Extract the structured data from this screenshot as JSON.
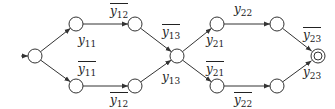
{
  "diagram": {
    "type": "finite-automaton",
    "nodes": [
      {
        "id": "s0",
        "x": 35,
        "y": 56,
        "kind": "initial"
      },
      {
        "id": "s1",
        "x": 76,
        "y": 24
      },
      {
        "id": "s2",
        "x": 76,
        "y": 86
      },
      {
        "id": "s3",
        "x": 135,
        "y": 24
      },
      {
        "id": "s4",
        "x": 135,
        "y": 86
      },
      {
        "id": "s5",
        "x": 177,
        "y": 56
      },
      {
        "id": "s6",
        "x": 217,
        "y": 24
      },
      {
        "id": "s7",
        "x": 217,
        "y": 86
      },
      {
        "id": "s8",
        "x": 277,
        "y": 24
      },
      {
        "id": "s9",
        "x": 277,
        "y": 86
      },
      {
        "id": "s10",
        "x": 318,
        "y": 56,
        "kind": "accepting"
      }
    ],
    "edges": [
      {
        "from": "s0",
        "to": "s1",
        "label": "y11"
      },
      {
        "from": "s0",
        "to": "s2",
        "label": "not y11"
      },
      {
        "from": "s1",
        "to": "s3",
        "label": "not y12"
      },
      {
        "from": "s2",
        "to": "s4",
        "label": "not y12"
      },
      {
        "from": "s3",
        "to": "s5",
        "label": "not y13"
      },
      {
        "from": "s4",
        "to": "s5",
        "label": "y13"
      },
      {
        "from": "s5",
        "to": "s6",
        "label": "y21"
      },
      {
        "from": "s5",
        "to": "s7",
        "label": "not y21"
      },
      {
        "from": "s6",
        "to": "s8",
        "label": "y22"
      },
      {
        "from": "s7",
        "to": "s9",
        "label": "not y22"
      },
      {
        "from": "s8",
        "to": "s10",
        "label": "not y23"
      },
      {
        "from": "s9",
        "to": "s10",
        "label": "y23"
      }
    ],
    "labels": [
      {
        "base": "y",
        "sub": "12",
        "over": true,
        "x": 110,
        "y": 3
      },
      {
        "base": "y",
        "sub": "11",
        "over": false,
        "x": 78,
        "y": 34
      },
      {
        "base": "y",
        "sub": "11",
        "over": true,
        "x": 78,
        "y": 61
      },
      {
        "base": "y",
        "sub": "12",
        "over": true,
        "x": 110,
        "y": 92
      },
      {
        "base": "y",
        "sub": "13",
        "over": true,
        "x": 162,
        "y": 24
      },
      {
        "base": "y",
        "sub": "13",
        "over": false,
        "x": 162,
        "y": 71
      },
      {
        "base": "y",
        "sub": "22",
        "over": false,
        "x": 234,
        "y": 3
      },
      {
        "base": "y",
        "sub": "21",
        "over": false,
        "x": 206,
        "y": 34
      },
      {
        "base": "y",
        "sub": "21",
        "over": true,
        "x": 206,
        "y": 61
      },
      {
        "base": "y",
        "sub": "22",
        "over": true,
        "x": 234,
        "y": 92
      },
      {
        "base": "y",
        "sub": "23",
        "over": true,
        "x": 303,
        "y": 27
      },
      {
        "base": "y",
        "sub": "23",
        "over": false,
        "x": 303,
        "y": 66
      }
    ],
    "colors": {
      "stroke": "#333333",
      "background": "#ffffff"
    }
  }
}
